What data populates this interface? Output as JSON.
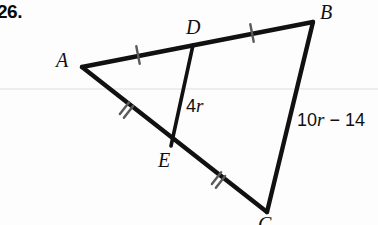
{
  "page": {
    "background_color": "#fdfdfd",
    "width": 378,
    "height": 225,
    "ink_color": "#111111",
    "rule_line_color": "#ededed"
  },
  "problem": {
    "number": "26."
  },
  "figure": {
    "type": "triangle-with-midsegment",
    "vertices": [
      {
        "name": "A",
        "label": "A",
        "x": 82,
        "y": 67
      },
      {
        "name": "B",
        "label": "B",
        "x": 313,
        "y": 22
      },
      {
        "name": "C",
        "label": "C",
        "x": 267,
        "y": 212
      },
      {
        "name": "D",
        "label": "D",
        "x": 193,
        "y": 45
      },
      {
        "name": "E",
        "label": "E",
        "x": 171,
        "y": 146
      }
    ],
    "segments": [
      {
        "name": "AB",
        "from": "A",
        "to": "B"
      },
      {
        "name": "BC",
        "from": "B",
        "to": "C"
      },
      {
        "name": "CA",
        "from": "C",
        "to": "A"
      },
      {
        "name": "DE",
        "from": "D",
        "to": "E"
      }
    ],
    "tick_marks": [
      {
        "name": "tick-AD",
        "segment": "AD",
        "count": 1,
        "x": 138,
        "y": 55
      },
      {
        "name": "tick-DB",
        "segment": "DB",
        "count": 1,
        "x": 252,
        "y": 33
      },
      {
        "name": "tick-AE",
        "segment": "AE",
        "count": 2,
        "x": 126,
        "y": 110
      },
      {
        "name": "tick-EC",
        "segment": "EC",
        "count": 2,
        "x": 218,
        "y": 180
      }
    ],
    "measures": [
      {
        "name": "measure-DE",
        "segment": "DE",
        "coefficient": "4",
        "variable": "r",
        "text": "4r"
      },
      {
        "name": "measure-BC",
        "segment": "BC",
        "coefficient": "10",
        "variable": "r",
        "operator": "−",
        "constant": "14",
        "text": "10r − 14",
        "clipped": true
      }
    ]
  }
}
